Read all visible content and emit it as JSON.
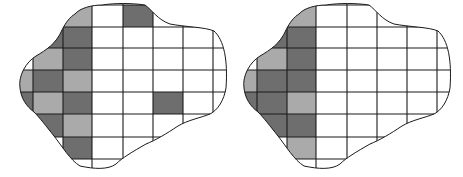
{
  "figure": {
    "colors": {
      "dark": "#6e6e6e",
      "light": "#aaaaaa",
      "empty": "#ffffff",
      "line": "#1a1a1a"
    },
    "panels": [
      {
        "name": "left-panel",
        "offset_x": 0,
        "cols": [
          11,
          33,
          63,
          92,
          123,
          153,
          183,
          213,
          230
        ],
        "rows": [
          0,
          5,
          27,
          48,
          70,
          92,
          114,
          137,
          159,
          170
        ],
        "cells": [
          {
            "c": 2,
            "r": 1,
            "shade": "light"
          },
          {
            "c": 4,
            "r": 1,
            "shade": "dark"
          },
          {
            "c": 1,
            "r": 2,
            "shade": "dark"
          },
          {
            "c": 2,
            "r": 2,
            "shade": "dark"
          },
          {
            "c": 1,
            "r": 3,
            "shade": "light"
          },
          {
            "c": 2,
            "r": 3,
            "shade": "dark"
          },
          {
            "c": 0,
            "r": 4,
            "shade": "light"
          },
          {
            "c": 1,
            "r": 4,
            "shade": "dark"
          },
          {
            "c": 2,
            "r": 4,
            "shade": "light"
          },
          {
            "c": 0,
            "r": 5,
            "shade": "dark"
          },
          {
            "c": 1,
            "r": 5,
            "shade": "light"
          },
          {
            "c": 2,
            "r": 5,
            "shade": "dark"
          },
          {
            "c": 5,
            "r": 5,
            "shade": "dark"
          },
          {
            "c": 1,
            "r": 6,
            "shade": "dark"
          },
          {
            "c": 2,
            "r": 6,
            "shade": "light"
          },
          {
            "c": 2,
            "r": 7,
            "shade": "dark"
          }
        ]
      },
      {
        "name": "right-panel",
        "offset_x": 224,
        "cols": [
          11,
          33,
          63,
          92,
          123,
          153,
          183,
          213,
          230
        ],
        "rows": [
          0,
          5,
          27,
          48,
          70,
          92,
          114,
          137,
          159,
          170
        ],
        "cells": [
          {
            "c": 2,
            "r": 1,
            "shade": "light"
          },
          {
            "c": 1,
            "r": 2,
            "shade": "dark"
          },
          {
            "c": 2,
            "r": 2,
            "shade": "dark"
          },
          {
            "c": 1,
            "r": 3,
            "shade": "light"
          },
          {
            "c": 2,
            "r": 3,
            "shade": "dark"
          },
          {
            "c": 0,
            "r": 4,
            "shade": "light"
          },
          {
            "c": 1,
            "r": 4,
            "shade": "dark"
          },
          {
            "c": 2,
            "r": 4,
            "shade": "dark"
          },
          {
            "c": 0,
            "r": 5,
            "shade": "dark"
          },
          {
            "c": 1,
            "r": 5,
            "shade": "dark"
          },
          {
            "c": 2,
            "r": 5,
            "shade": "light"
          },
          {
            "c": 1,
            "r": 6,
            "shade": "dark"
          },
          {
            "c": 2,
            "r": 6,
            "shade": "dark"
          },
          {
            "c": 2,
            "r": 7,
            "shade": "light"
          }
        ]
      }
    ]
  }
}
